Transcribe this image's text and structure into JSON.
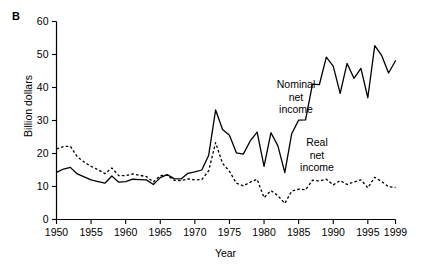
{
  "figure": {
    "panel_label": "B",
    "background_color": "#ffffff",
    "ink_color": "#000000"
  },
  "chart_data": {
    "type": "line",
    "title": "",
    "subtitle": "",
    "xlabel": "Year",
    "ylabel": "Billion dollars",
    "xlim": [
      1950,
      1999
    ],
    "ylim": [
      0,
      60
    ],
    "grid": false,
    "legend_position": "inline-annotations",
    "xticks": [
      1950,
      1955,
      1960,
      1965,
      1970,
      1975,
      1980,
      1985,
      1990,
      1995,
      1999
    ],
    "xtick_labels": [
      "1950",
      "1955",
      "1960",
      "1965",
      "1970",
      "1975",
      "1980",
      "1985",
      "1990",
      "1995",
      "1999"
    ],
    "yticks": [
      0,
      10,
      20,
      30,
      40,
      50,
      60
    ],
    "ytick_labels": [
      "0",
      "10",
      "20",
      "30",
      "40",
      "50",
      "60"
    ],
    "x": [
      1950,
      1951,
      1952,
      1953,
      1954,
      1955,
      1956,
      1957,
      1958,
      1959,
      1960,
      1961,
      1962,
      1963,
      1964,
      1965,
      1966,
      1967,
      1968,
      1969,
      1970,
      1971,
      1972,
      1973,
      1974,
      1975,
      1976,
      1977,
      1978,
      1979,
      1980,
      1981,
      1982,
      1983,
      1984,
      1985,
      1986,
      1987,
      1988,
      1989,
      1990,
      1991,
      1992,
      1993,
      1994,
      1995,
      1996,
      1997,
      1998,
      1999
    ],
    "series": [
      {
        "name": "Nominal net income",
        "style": "solid",
        "color": "#000000",
        "annotation": "Nominal\nnet\nincome",
        "values": [
          14.3,
          15.3,
          15.8,
          13.8,
          12.9,
          12.0,
          11.5,
          11.0,
          13.2,
          11.3,
          11.5,
          12.2,
          12.1,
          12.0,
          10.6,
          12.7,
          13.6,
          12.4,
          12.3,
          14.0,
          14.4,
          15.0,
          19.5,
          33.2,
          27.3,
          25.5,
          20.2,
          19.8,
          23.8,
          26.5,
          16.1,
          26.3,
          22.3,
          14.2,
          26.0,
          30.1,
          30.2,
          41.0,
          40.9,
          49.2,
          46.5,
          38.2,
          47.3,
          42.8,
          45.8,
          36.9,
          52.7,
          49.7,
          44.4,
          48.1
        ]
      },
      {
        "name": "Real net income",
        "style": "dashed",
        "color": "#000000",
        "annotation": "Real\nnet\nincome",
        "values": [
          21.4,
          22.1,
          22.2,
          19.0,
          17.4,
          16.1,
          15.1,
          13.9,
          15.6,
          13.3,
          13.3,
          13.8,
          13.4,
          13.0,
          11.4,
          13.3,
          13.4,
          11.9,
          11.8,
          12.3,
          12.0,
          12.1,
          14.8,
          23.3,
          17.0,
          14.6,
          11.0,
          10.2,
          11.3,
          12.2,
          6.6,
          8.8,
          7.2,
          4.9,
          8.6,
          9.2,
          9.0,
          11.9,
          11.7,
          12.2,
          10.5,
          11.8,
          10.6,
          11.4,
          12.0,
          9.6,
          12.8,
          11.5,
          9.9,
          9.7
        ]
      }
    ],
    "annotations": [
      {
        "text_lines": [
          "Nominal",
          "net",
          "income"
        ],
        "x_px": 296,
        "y_px": 88
      },
      {
        "text_lines": [
          "Real",
          "net",
          "income"
        ],
        "x_px": 317,
        "y_px": 146
      }
    ]
  }
}
